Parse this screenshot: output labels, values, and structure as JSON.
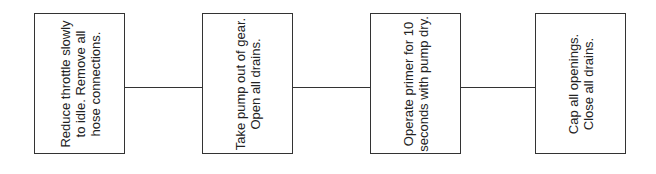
{
  "diagram": {
    "type": "flowchart",
    "orientation": "horizontal",
    "text_rotation": "-90deg",
    "colors": {
      "stroke": "#333333",
      "text": "#222222",
      "background": "#ffffff"
    },
    "steps": [
      {
        "id": 1,
        "text": "Reduce throttle slowly to idle. Remove all hose connections."
      },
      {
        "id": 2,
        "text": "Take pump out of gear. Open all drains."
      },
      {
        "id": 3,
        "text": "Operate primer for 10 seconds with pump dry."
      },
      {
        "id": 4,
        "text": "Cap all openings. Close all drains."
      }
    ],
    "connections": [
      {
        "from": 1,
        "to": 2
      },
      {
        "from": 2,
        "to": 3
      },
      {
        "from": 3,
        "to": 4
      }
    ]
  }
}
